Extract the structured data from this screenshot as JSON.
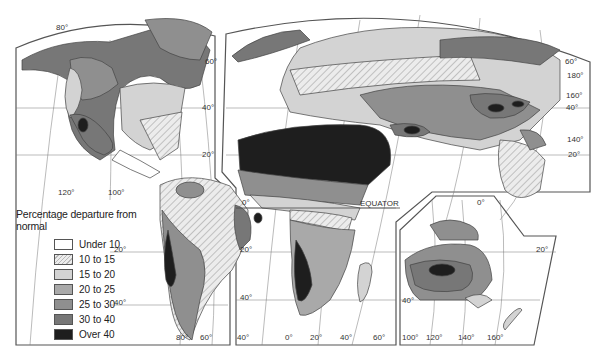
{
  "map": {
    "title": "Percentage departure from normal",
    "subject": "Variability of annual precipitation (world)",
    "equator_label": "EQUATOR",
    "legend": [
      {
        "label": "Under 10",
        "color": "#ffffff",
        "pattern": "none"
      },
      {
        "label": "10 to 15",
        "color": "#e6e6e6",
        "pattern": "hatch"
      },
      {
        "label": "15 to 20",
        "color": "#d3d3d3",
        "pattern": "none"
      },
      {
        "label": "20 to 25",
        "color": "#a9a9a9",
        "pattern": "none"
      },
      {
        "label": "25 to 30",
        "color": "#8f8f8f",
        "pattern": "none"
      },
      {
        "label": "30 to 40",
        "color": "#777777",
        "pattern": "none"
      },
      {
        "label": "Over 40",
        "color": "#1e1e1e",
        "pattern": "none"
      }
    ],
    "graticule_labels": {
      "americas": [
        "80°",
        "60°",
        "40°",
        "20°",
        "120°",
        "100°",
        "20°",
        "40°",
        "80°",
        "60°",
        "40°"
      ],
      "africa_eurasia": [
        "0°",
        "20°",
        "40°",
        "60°",
        "40°",
        "20°",
        "0°",
        "60°",
        "180°",
        "160°",
        "40°",
        "140°",
        "20°"
      ],
      "australia": [
        "100°",
        "120°",
        "140°",
        "160°",
        "40°",
        "20°",
        "0°"
      ]
    }
  }
}
